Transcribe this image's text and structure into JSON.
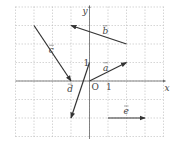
{
  "figure": {
    "type": "coordinate-grid-vectors",
    "axes": {
      "x_label": "x",
      "y_label": "y",
      "origin_label": "O",
      "x_tick_label": "1",
      "y_tick_label": "1"
    },
    "grid": {
      "x_range": [
        -4,
        4
      ],
      "y_range": [
        -3,
        4
      ],
      "step": 1,
      "style": "dashed"
    },
    "vectors": [
      {
        "name": "a",
        "label": "a",
        "from": [
          0,
          0
        ],
        "to": [
          2,
          1
        ]
      },
      {
        "name": "b",
        "label": "b",
        "from": [
          2,
          2
        ],
        "to": [
          -1,
          3
        ]
      },
      {
        "name": "c",
        "label": "c",
        "from": [
          -3,
          3
        ],
        "to": [
          -1,
          0
        ]
      },
      {
        "name": "d",
        "label": "d",
        "from": [
          0,
          1
        ],
        "to": [
          -1,
          -2
        ]
      },
      {
        "name": "e",
        "label": "e",
        "from": [
          1,
          -2
        ],
        "to": [
          3,
          -2
        ]
      }
    ],
    "colors": {
      "grid": "#bbbbbb",
      "axis": "#666666",
      "vector": "#333333",
      "text": "#444444"
    }
  }
}
